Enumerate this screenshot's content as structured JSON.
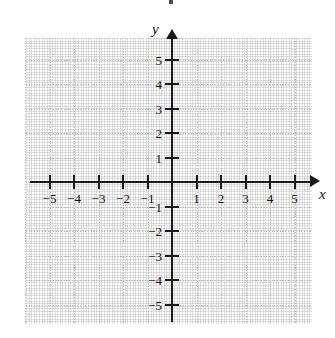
{
  "figure": {
    "type": "coordinate-plane",
    "background_color": "#ffffff",
    "axis_color": "#1a1a1a",
    "grid_color": "#b9b9b9",
    "label_color": "#111111"
  },
  "axes": {
    "x_label": "x",
    "y_label": "y",
    "x_arrow": "arrow-right",
    "y_arrow": "arrow-up"
  },
  "artifact": {
    "name": "scan-speck"
  },
  "chart_data": {
    "type": "scatter",
    "title": "",
    "xlabel": "x",
    "ylabel": "y",
    "xlim": [
      -5.8,
      5.9
    ],
    "ylim": [
      -5.8,
      5.9
    ],
    "grid": true,
    "grid_style": "dotted",
    "legend": "none",
    "series": [],
    "x_ticks": [
      -5,
      -4,
      -3,
      -2,
      -1,
      1,
      2,
      3,
      4,
      5
    ],
    "y_ticks": [
      5,
      4,
      3,
      2,
      1,
      -1,
      -2,
      -3,
      -4,
      -5
    ],
    "x_tick_labels": [
      "−5",
      "−4",
      "−3",
      "−2",
      "−1",
      "1",
      "2",
      "3",
      "4",
      "5"
    ],
    "y_tick_labels": [
      "5",
      "4",
      "3",
      "2",
      "1",
      "−1",
      "−2",
      "−3",
      "−4",
      "−5"
    ],
    "unit_px": 24.5,
    "origin_px": [
      172,
      182
    ]
  }
}
